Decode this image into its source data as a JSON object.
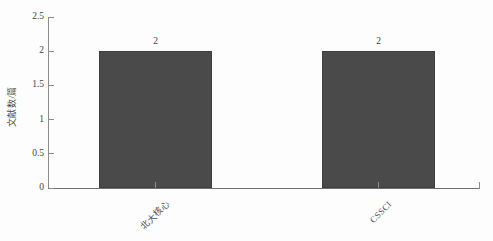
{
  "chart_data": {
    "type": "bar",
    "title": "",
    "subtitle": "",
    "xlabel": "",
    "ylabel": "文献数/篇",
    "categories": [
      "北大核心",
      "CSSCI"
    ],
    "values": [
      2,
      2
    ],
    "value_labels": [
      "2",
      "2"
    ],
    "ylim": [
      0,
      2.5
    ],
    "ytick_labels": [
      "0",
      "0.5",
      "1",
      "1.5",
      "2",
      "2.5"
    ],
    "ytick_values": [
      0,
      0.5,
      1,
      1.5,
      2,
      2.5
    ],
    "grid": false,
    "legend": false,
    "legend_position": "none",
    "bar_color": "#4a4a4a",
    "axis_color": "#8c8c8c",
    "background_color": "#ffffff"
  },
  "axes": {
    "y_label_text": "文献数/篇"
  }
}
